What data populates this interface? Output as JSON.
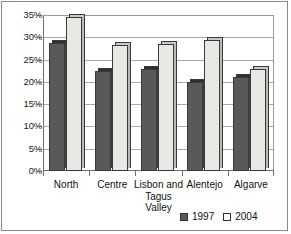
{
  "chart_data": {
    "type": "bar",
    "title": "",
    "xlabel": "",
    "ylabel": "",
    "categories": [
      "North",
      "Centre",
      "Lisbon and Tagus Valley",
      "Alentejo",
      "Algarve"
    ],
    "category_lines": [
      [
        "North"
      ],
      [
        "Centre"
      ],
      [
        "Lisbon and",
        "Tagus",
        "Valley"
      ],
      [
        "Alentejo"
      ],
      [
        "Algarve"
      ]
    ],
    "series": [
      {
        "name": "1997",
        "color": "#595959",
        "values": [
          28.8,
          22.5,
          23.0,
          20.0,
          21.0
        ]
      },
      {
        "name": "2004",
        "color": "#e8e8e4",
        "values": [
          34.5,
          28.3,
          28.5,
          29.5,
          23.0
        ]
      }
    ],
    "ylim": [
      0,
      35
    ],
    "ytick_step": 5,
    "ytick_labels": [
      "35%",
      "30%",
      "25%",
      "20%",
      "15%",
      "10%",
      "5%",
      "0%"
    ],
    "ytick_values": [
      35,
      30,
      25,
      20,
      15,
      10,
      5,
      0
    ],
    "grid": true,
    "legend_position": "bottom-right",
    "value_format": "percent"
  },
  "legend": {
    "items": [
      {
        "label": "1997",
        "style": "dark"
      },
      {
        "label": "2004",
        "style": "light"
      }
    ]
  }
}
